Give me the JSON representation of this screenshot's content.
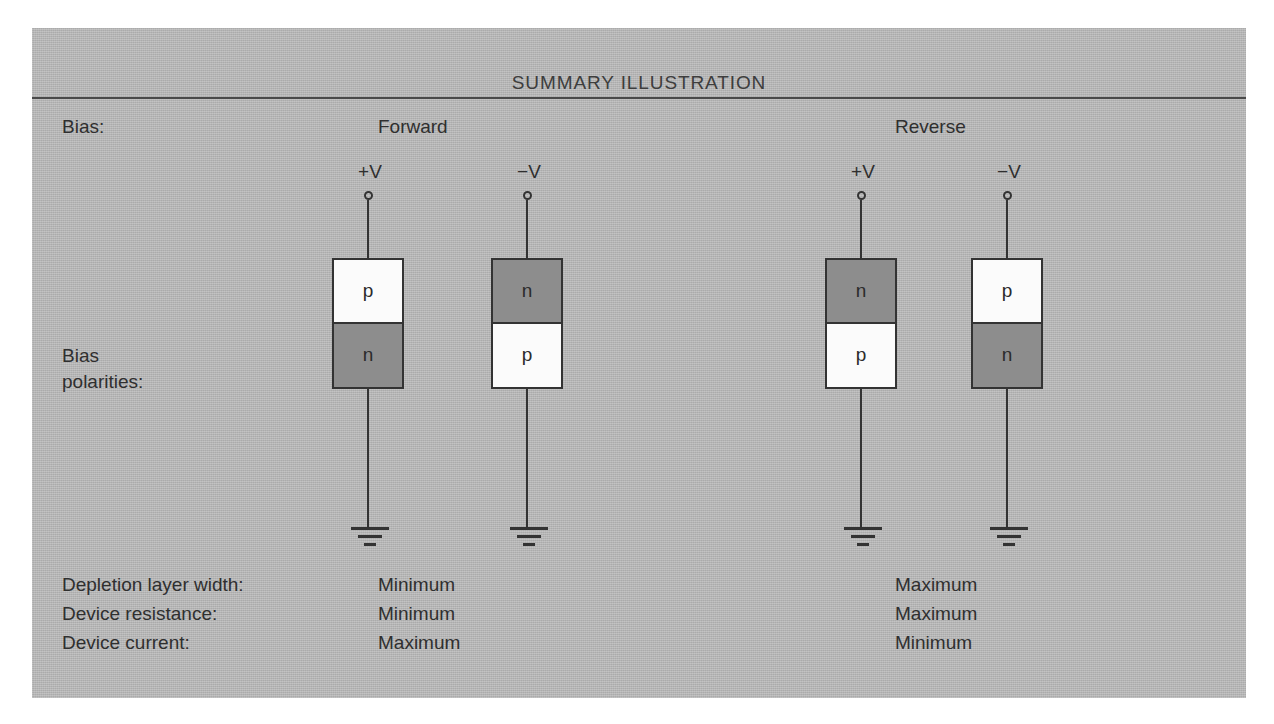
{
  "figure": {
    "title": "SUMMARY ILLUSTRATION",
    "background_color": "#b7b7b7",
    "page_background_color": "#ffffff",
    "line_color": "#333333",
    "text_color": "#2f2f2f",
    "p_region_color": "#fbfbfb",
    "n_region_color": "#8d8d8d"
  },
  "bias_row": {
    "label": "Bias:",
    "forward": "Forward",
    "reverse": "Reverse"
  },
  "polarity_row": {
    "label_line1": "Bias",
    "label_line2": "polarities:"
  },
  "circuits": [
    {
      "group": "forward",
      "voltage_label": "+V",
      "terminal": "open-circle",
      "ground": "earth-ground",
      "top_region": {
        "text": "p",
        "shade": "light"
      },
      "bottom_region": {
        "text": "n",
        "shade": "dark"
      },
      "left": 298
    },
    {
      "group": "forward",
      "voltage_label": "−V",
      "terminal": "open-circle",
      "ground": "earth-ground",
      "top_region": {
        "text": "n",
        "shade": "dark"
      },
      "bottom_region": {
        "text": "p",
        "shade": "light"
      },
      "left": 457
    },
    {
      "group": "reverse",
      "voltage_label": "+V",
      "terminal": "open-circle",
      "ground": "earth-ground",
      "top_region": {
        "text": "n",
        "shade": "dark"
      },
      "bottom_region": {
        "text": "p",
        "shade": "light"
      },
      "left": 791
    },
    {
      "group": "reverse",
      "voltage_label": "−V",
      "terminal": "open-circle",
      "ground": "earth-ground",
      "top_region": {
        "text": "p",
        "shade": "light"
      },
      "bottom_region": {
        "text": "n",
        "shade": "dark"
      },
      "left": 937
    }
  ],
  "summary_rows": [
    {
      "label": "Depletion layer width:",
      "forward": "Minimum",
      "reverse": "Maximum",
      "top": 546
    },
    {
      "label": "Device resistance:",
      "forward": "Minimum",
      "reverse": "Maximum",
      "top": 575
    },
    {
      "label": "Device current:",
      "forward": "Maximum",
      "reverse": "Minimum",
      "top": 604
    }
  ]
}
